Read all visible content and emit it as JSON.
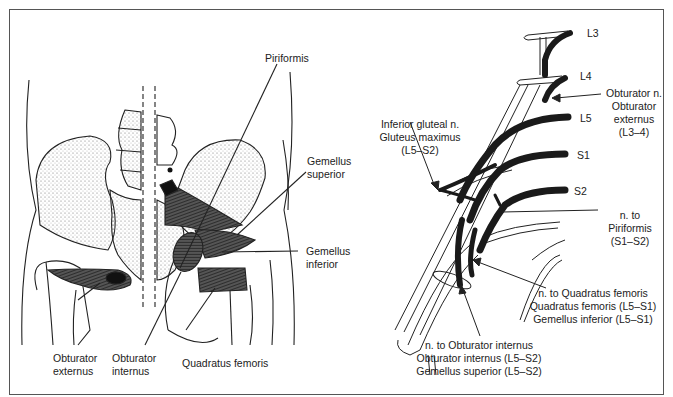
{
  "figure": {
    "left_panel": {
      "labels": {
        "piriformis": "Piriformis",
        "gemellus_superior": [
          "Gemellus",
          "superior"
        ],
        "gemellus_inferior": [
          "Gemellus",
          "inferior"
        ],
        "obturator_externus": [
          "Obturator",
          "externus"
        ],
        "obturator_internus": [
          "Obturator",
          "internus"
        ],
        "quadratus_femoris": "Quadratus femoris"
      }
    },
    "right_panel": {
      "roots": [
        "L3",
        "L4",
        "L5",
        "S1",
        "S2"
      ],
      "labels": {
        "obturator_n": [
          "Obturator n.",
          "Obturator",
          "externus",
          "(L3–4)"
        ],
        "inferior_gluteal_n": [
          "Inferior gluteal n.",
          "Gluteus maximus",
          "(L5–S2)"
        ],
        "n_to_piriformis": [
          "n. to",
          "Piriformis",
          "(S1–S2)"
        ],
        "n_to_quadratus_femoris": [
          "n. to Quadratus femoris",
          "Quadratus femoris (L5–S1)",
          "Gemellus inferior (L5–S1)"
        ],
        "n_to_obturator_internus": [
          "n. to Obturator internus",
          "Obturator internus (L5–S2)",
          "Gemellus superior (L5–S2)"
        ]
      }
    },
    "colors": {
      "ink": "#222222",
      "muscle": "#3a3a3a",
      "frame": "#555555",
      "paper": "#ffffff"
    }
  }
}
